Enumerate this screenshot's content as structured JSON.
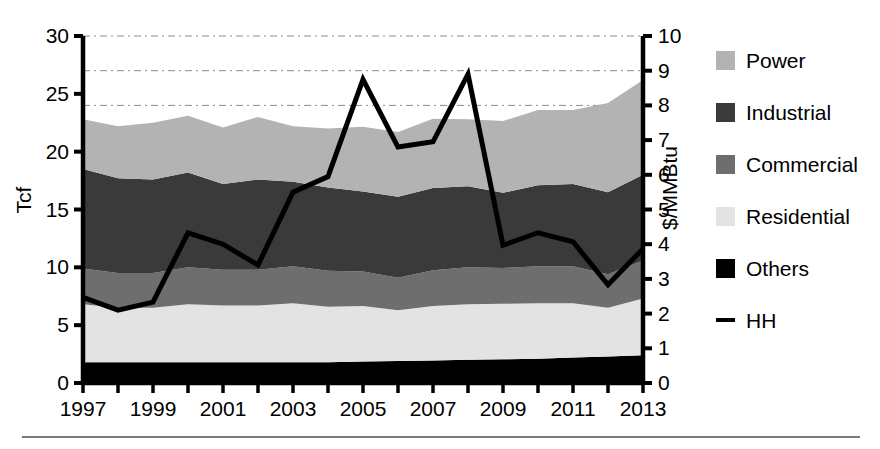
{
  "chart_data": {
    "type": "area",
    "title": "",
    "subtitle": "",
    "xlabel": "",
    "ylabel": "Tcf",
    "y2label": "$/MMBtu",
    "x": [
      1997,
      1998,
      1999,
      2000,
      2001,
      2002,
      2003,
      2004,
      2005,
      2006,
      2007,
      2008,
      2009,
      2010,
      2011,
      2012,
      2013
    ],
    "xtick_labels": [
      "1997",
      "1999",
      "2001",
      "2003",
      "2005",
      "2007",
      "2009",
      "2011",
      "2013"
    ],
    "xtick_values": [
      1997,
      1999,
      2001,
      2003,
      2005,
      2007,
      2009,
      2011,
      2013
    ],
    "xlim": [
      1997,
      2013
    ],
    "ylim": [
      0,
      30
    ],
    "ytick_labels": [
      "0",
      "5",
      "10",
      "15",
      "20",
      "25",
      "30"
    ],
    "ytick_values": [
      0,
      5,
      10,
      15,
      20,
      25,
      30
    ],
    "y2lim": [
      0,
      10
    ],
    "y2tick_labels": [
      "0",
      "1",
      "2",
      "3",
      "4",
      "5",
      "6",
      "7",
      "8",
      "9",
      "10"
    ],
    "y2tick_values": [
      0,
      1,
      2,
      3,
      4,
      5,
      6,
      7,
      8,
      9,
      10
    ],
    "grid": "horizontal-dashed",
    "gridline_values_left": [
      24,
      27,
      30
    ],
    "legend_position": "right",
    "stacked": true,
    "stack_order": [
      "Others",
      "Residential",
      "Commercial",
      "Industrial",
      "Power"
    ],
    "series": [
      {
        "name": "Others",
        "color": "#000000",
        "kind": "area",
        "values": [
          1.8,
          1.8,
          1.8,
          1.8,
          1.8,
          1.8,
          1.8,
          1.8,
          1.85,
          1.9,
          1.95,
          2.0,
          2.05,
          2.1,
          2.2,
          2.3,
          2.4
        ]
      },
      {
        "name": "Residential",
        "color": "#e3e3e3",
        "kind": "area",
        "values": [
          5.0,
          4.7,
          4.7,
          5.0,
          4.9,
          4.9,
          5.1,
          4.8,
          4.8,
          4.4,
          4.7,
          4.8,
          4.8,
          4.8,
          4.7,
          4.2,
          4.9
        ]
      },
      {
        "name": "Commercial",
        "color": "#6e6e6e",
        "kind": "area",
        "values": [
          3.1,
          3.0,
          3.0,
          3.2,
          3.1,
          3.1,
          3.2,
          3.1,
          3.0,
          2.8,
          3.1,
          3.2,
          3.1,
          3.2,
          3.2,
          2.9,
          3.3
        ]
      },
      {
        "name": "Industrial",
        "color": "#3a3a3a",
        "kind": "area",
        "values": [
          8.6,
          8.2,
          8.1,
          8.2,
          7.4,
          7.8,
          7.3,
          7.2,
          6.9,
          7.0,
          7.1,
          7.0,
          6.5,
          7.0,
          7.1,
          7.1,
          7.4
        ]
      },
      {
        "name": "Power",
        "color": "#b3b3b3",
        "kind": "area",
        "values": [
          4.3,
          4.5,
          4.9,
          4.9,
          4.9,
          5.4,
          4.8,
          5.1,
          5.6,
          5.6,
          6.0,
          5.8,
          6.2,
          6.5,
          6.4,
          7.7,
          8.2
        ]
      },
      {
        "name": "HH",
        "color": "#000000",
        "kind": "line",
        "axis": "right",
        "unit": "$/MMBtu",
        "values": [
          2.47,
          2.1,
          2.33,
          4.33,
          4.0,
          3.4,
          5.5,
          5.95,
          8.75,
          6.8,
          6.95,
          8.9,
          3.97,
          4.33,
          4.07,
          2.83,
          3.87
        ]
      }
    ],
    "totals": [
      22.8,
      22.2,
      22.5,
      23.1,
      22.1,
      23.0,
      22.2,
      22.0,
      22.15,
      21.7,
      22.85,
      22.8,
      22.65,
      23.6,
      23.6,
      24.2,
      26.2
    ]
  },
  "legend": {
    "items": [
      {
        "label": "Power",
        "color": "#b3b3b3",
        "marker": "swatch"
      },
      {
        "label": "Industrial",
        "color": "#3a3a3a",
        "marker": "swatch"
      },
      {
        "label": "Commercial",
        "color": "#6e6e6e",
        "marker": "swatch"
      },
      {
        "label": "Residential",
        "color": "#e3e3e3",
        "marker": "swatch"
      },
      {
        "label": "Others",
        "color": "#000000",
        "marker": "swatch"
      },
      {
        "label": "HH",
        "color": "#000000",
        "marker": "line"
      }
    ]
  },
  "axes": {
    "left_title": "Tcf",
    "right_title": "$/MMBtu"
  }
}
